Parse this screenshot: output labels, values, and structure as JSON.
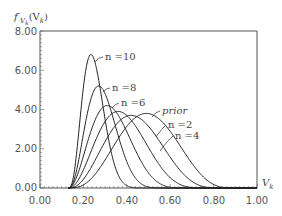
{
  "chart_data": {
    "type": "line",
    "title": "",
    "ylabel": "f'_{V_k}(V_k)",
    "xlabel": "V_k",
    "xlim": [
      0.0,
      1.0
    ],
    "ylim": [
      0.0,
      8.0
    ],
    "x_ticks": [
      "0.00",
      "0.20",
      "0.40",
      "0.60",
      "0.80",
      "1.00"
    ],
    "y_ticks": [
      "0.00",
      "2.00",
      "4.00",
      "6.00",
      "8.00"
    ],
    "grid": false,
    "legend": "inline labels",
    "series": [
      {
        "name": "n=10",
        "peak_x": 0.235,
        "peak_y": 6.8,
        "support": [
          0.13,
          0.45
        ]
      },
      {
        "name": "n=8",
        "peak_x": 0.27,
        "peak_y": 5.2,
        "support": [
          0.13,
          0.52
        ]
      },
      {
        "name": "n=6",
        "peak_x": 0.31,
        "peak_y": 4.2,
        "support": [
          0.13,
          0.6
        ]
      },
      {
        "name": "n=4",
        "peak_x": 0.36,
        "peak_y": 3.9,
        "support": [
          0.13,
          0.68
        ]
      },
      {
        "name": "n=2",
        "peak_x": 0.42,
        "peak_y": 3.7,
        "support": [
          0.13,
          0.74
        ]
      },
      {
        "name": "prior",
        "peak_x": 0.49,
        "peak_y": 3.8,
        "support": [
          0.13,
          0.8
        ]
      }
    ]
  },
  "labels": {
    "y_axis_title": "f′",
    "y_axis_sub": "V",
    "y_axis_subsub": "k",
    "y_axis_paren": "(V",
    "y_axis_paren_sub": "k",
    "y_axis_close": ")",
    "x_axis_title": "V",
    "x_axis_sub": "k",
    "n10": "n =10",
    "n8": "n =8",
    "n6": "n =6",
    "prior": "prior",
    "n2": "n =2",
    "n4": "n =4"
  }
}
